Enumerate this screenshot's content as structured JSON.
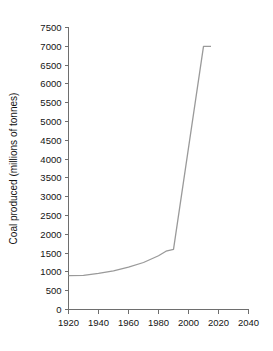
{
  "chart_data": {
    "type": "line",
    "title": "",
    "xlabel": "",
    "ylabel": "Coal produced (millions of tonnes)",
    "xlim": [
      1920,
      2040
    ],
    "ylim": [
      0,
      7500
    ],
    "grid": false,
    "legend": "none",
    "x_ticks": [
      1920,
      1940,
      1960,
      1980,
      2000,
      2020,
      2040
    ],
    "x_tick_labels": [
      "1920",
      "1940",
      "1960",
      "1980",
      "2000",
      "2020",
      "2040"
    ],
    "y_ticks": [
      0,
      500,
      1000,
      1500,
      2000,
      2500,
      3000,
      3500,
      4000,
      4500,
      5000,
      5500,
      6000,
      6500,
      7000,
      7500
    ],
    "y_tick_labels": [
      "0",
      "500",
      "1000",
      "1500",
      "2000",
      "2500",
      "3000",
      "3500",
      "4000",
      "4500",
      "5000",
      "5500",
      "6000",
      "6500",
      "7000",
      "7500"
    ],
    "series": [
      {
        "name": "Coal produced",
        "color": "#9a9a9a",
        "x": [
          1920,
          1930,
          1940,
          1950,
          1960,
          1970,
          1980,
          1985,
          1990,
          2010,
          2015
        ],
        "values": [
          900,
          910,
          960,
          1030,
          1130,
          1250,
          1430,
          1550,
          1600,
          7000,
          7000
        ]
      }
    ],
    "axis_color": "#6e6e6e",
    "text_color": "#141414",
    "background": "#ffffff"
  }
}
